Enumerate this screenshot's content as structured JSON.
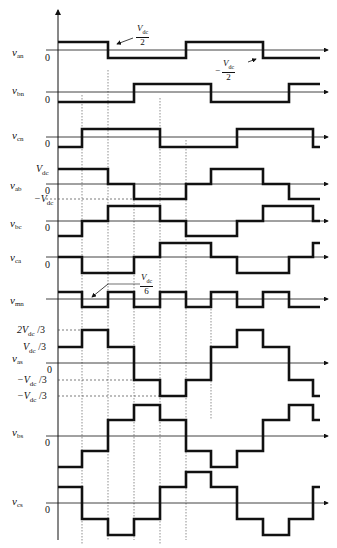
{
  "diagram": {
    "time_axis_x": [
      58,
      82,
      108,
      134,
      160,
      186,
      211,
      237,
      263,
      289,
      313,
      320
    ],
    "traces": [
      {
        "id": "van",
        "label": "v",
        "sub": "an",
        "zero_y": 50,
        "levels": [
          42,
          58
        ],
        "steps": [
          1,
          1,
          0,
          0,
          0,
          1,
          1,
          1,
          0,
          0,
          0
        ],
        "annotations": [
          "Vdc/2",
          "-Vdc/2"
        ]
      },
      {
        "id": "vbn",
        "label": "v",
        "sub": "bn",
        "zero_y": 92,
        "levels": [
          84,
          102
        ],
        "steps": [
          0,
          0,
          0,
          1,
          1,
          1,
          0,
          0,
          0,
          1,
          1
        ]
      },
      {
        "id": "vcn",
        "label": "v",
        "sub": "cn",
        "zero_y": 137,
        "levels": [
          129,
          147
        ],
        "steps": [
          0,
          1,
          1,
          1,
          0,
          0,
          0,
          1,
          1,
          1,
          0
        ]
      },
      {
        "id": "vab",
        "label": "v",
        "sub": "ab",
        "zero_y": 184,
        "levels": [
          169,
          184,
          199
        ],
        "steps": [
          2,
          2,
          1,
          0,
          0,
          1,
          2,
          2,
          1,
          0,
          0
        ]
      },
      {
        "id": "vbc",
        "label": "v",
        "sub": "bc",
        "zero_y": 221,
        "levels": [
          206,
          221,
          236
        ],
        "steps": [
          0,
          1,
          2,
          2,
          1,
          0,
          0,
          1,
          2,
          2,
          1
        ]
      },
      {
        "id": "vca",
        "label": "v",
        "sub": "ca",
        "zero_y": 257,
        "levels": [
          243,
          257,
          273
        ],
        "steps": [
          1,
          0,
          0,
          1,
          2,
          2,
          1,
          0,
          0,
          1,
          2
        ]
      },
      {
        "id": "vmn",
        "label": "v",
        "sub": "mn",
        "zero_y": 299,
        "levels": [
          292,
          307
        ],
        "steps": [
          1,
          0,
          1,
          0,
          1,
          0,
          1,
          0,
          1,
          0,
          0
        ]
      },
      {
        "id": "vas",
        "label": "v",
        "sub": "as",
        "zero_y": 363,
        "levels": [
          330,
          347,
          363,
          380,
          396
        ],
        "steps": [
          3,
          4,
          3,
          1,
          0,
          1,
          3,
          4,
          3,
          1,
          0
        ]
      },
      {
        "id": "vbs",
        "label": "v",
        "sub": "bs",
        "zero_y": 436,
        "levels": [
          405,
          420,
          436,
          451,
          467
        ],
        "steps": [
          0,
          1,
          3,
          4,
          3,
          1,
          0,
          1,
          3,
          4,
          3
        ]
      },
      {
        "id": "vcs",
        "label": "v",
        "sub": "cs",
        "zero_y": 503,
        "levels": [
          472,
          487,
          503,
          519,
          535
        ],
        "steps": [
          3,
          1,
          0,
          1,
          3,
          4,
          3,
          1,
          0,
          1,
          3
        ]
      }
    ],
    "labels": {
      "zero": "0",
      "vdc": "V",
      "vdc_sub": "dc",
      "neg_vdc": "−V",
      "vdc_half_num": "V",
      "vdc_half_den": "2",
      "neg_sign": "−",
      "vdc_sixth_den": "6",
      "two_vdc_3": "2V",
      "over3": " /3",
      "vdc_3": "V",
      "neg_vdc_3": "−V"
    }
  }
}
